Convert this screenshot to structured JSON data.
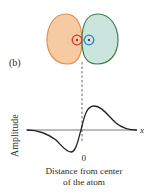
{
  "panel_label": "(b)",
  "orbital": {
    "left_lobe": {
      "fill": "#F6CBA3",
      "stroke": "#E0914E"
    },
    "right_lobe": {
      "fill": "#CBE4DD",
      "stroke": "#3F7F4E"
    },
    "left_ring": {
      "stroke": "#D7372B",
      "center": "#B82A22"
    },
    "right_ring": {
      "stroke": "#2F7FCF",
      "center": "#5A3A55"
    },
    "nodal_line_color": "#444444"
  },
  "graph": {
    "y_label": "Amplitude",
    "x_label": "x",
    "origin_label": "0",
    "caption_line1": "Distance from center",
    "caption_line2": "of the atom",
    "axis_color": "#555555",
    "curve_color": "#222222"
  }
}
